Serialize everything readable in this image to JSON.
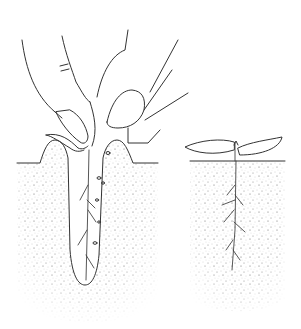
{
  "illustration": {
    "description": "Line drawing: hand planting a seedling into a narrow soil hole (left) and the established seedling with root system (right)",
    "background_color": "#ffffff",
    "line_color": "#333333",
    "stipple_color": "#666666",
    "panels": [
      {
        "id": "planting",
        "subject": "fingers pressing seedling into dibble hole in soil"
      },
      {
        "id": "established",
        "subject": "seedling with two cotyledon leaves above ground and branching root below"
      }
    ]
  }
}
